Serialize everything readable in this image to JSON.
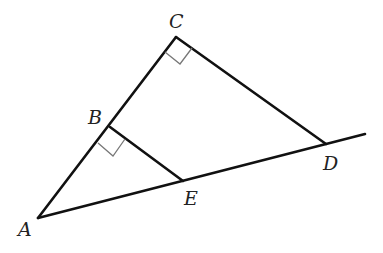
{
  "diagram": {
    "type": "geometry",
    "colors": {
      "line": "#111111",
      "right_angle_marker": "#777777",
      "label": "#222222",
      "background": "#ffffff"
    },
    "points": {
      "A": {
        "label": "A",
        "x": 38,
        "y": 218,
        "label_x": 18,
        "label_y": 236
      },
      "B": {
        "label": "B",
        "x": 110,
        "y": 127,
        "label_x": 88,
        "label_y": 124
      },
      "C": {
        "label": "C",
        "x": 176,
        "y": 37,
        "label_x": 169,
        "label_y": 28
      },
      "D": {
        "label": "D",
        "x": 326,
        "y": 144,
        "label_x": 323,
        "label_y": 170
      },
      "E": {
        "label": "E",
        "x": 183,
        "y": 181,
        "label_x": 184,
        "label_y": 205
      }
    },
    "segments": [
      {
        "name": "AC",
        "from": "A",
        "to": "C"
      },
      {
        "name": "CD",
        "from": "C",
        "to": "D"
      },
      {
        "name": "BE",
        "from": "B",
        "to": "E"
      },
      {
        "name": "A-ray",
        "from": "A",
        "to_xy": [
          365,
          134
        ]
      }
    ],
    "right_angles": [
      {
        "at": "C",
        "between": [
          "CA",
          "CD"
        ]
      },
      {
        "at": "B",
        "between": [
          "BA",
          "BE"
        ]
      }
    ]
  }
}
